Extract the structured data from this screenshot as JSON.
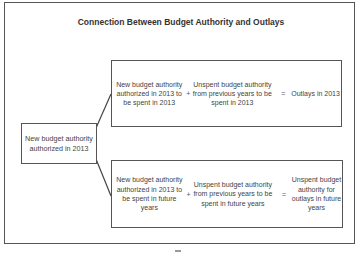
{
  "title": "Connection Between Budget Authority and Outlays",
  "source": {
    "label": "New budget authority authorized in 2013"
  },
  "top_equation": {
    "term1": "New budget authority authorized in 2013 to be spent in 2013",
    "operator1": "+",
    "term2": "Unspent budget authority from previous years to be spent in 2013",
    "operator2": "=",
    "result": "Outlays in 2013"
  },
  "bottom_equation": {
    "term1": "New budget authority authorized in 2013 to be spent in future years",
    "operator1": "+",
    "term2": "Unspent budget authority from previous years to be spent in future years",
    "operator2": "=",
    "result": "Unspent budget authority for outlays in future years"
  },
  "colors": {
    "border": "#555555",
    "text": "#444444",
    "background": "#ffffff"
  }
}
